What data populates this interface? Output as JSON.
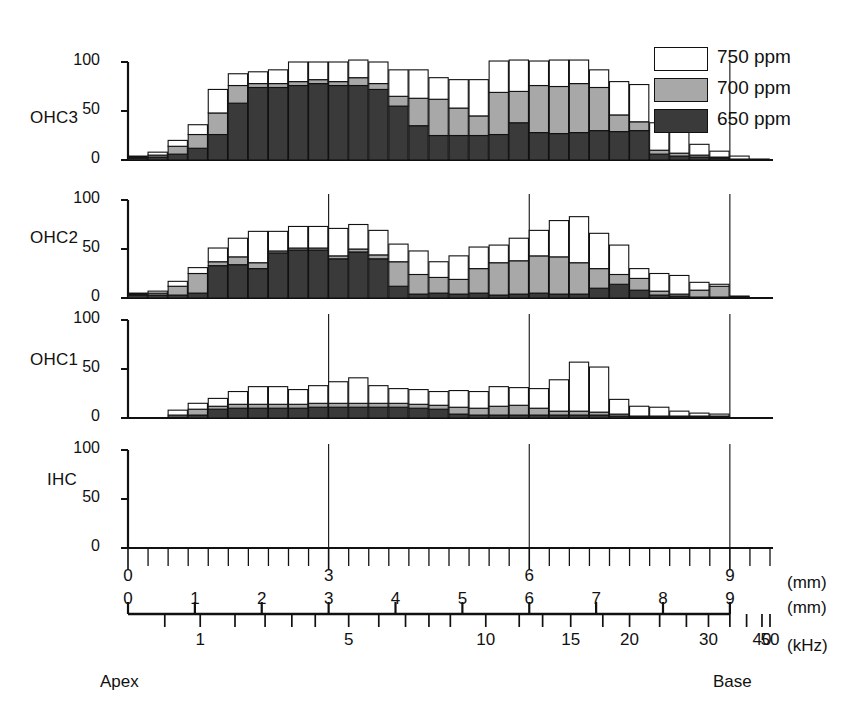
{
  "figure": {
    "type": "cochleogram",
    "panels_order": [
      "OHC3",
      "OHC2",
      "OHC1",
      "IHC"
    ],
    "apex_label": "Apex",
    "base_label": "Base"
  },
  "legend": {
    "position": "top-right",
    "items": [
      {
        "label": "750 ppm",
        "color": "#ffffff"
      },
      {
        "label": "700 ppm",
        "color": "#a8a8a8"
      },
      {
        "label": "650 ppm",
        "color": "#3a3a3a"
      }
    ]
  },
  "yaxis": {
    "ticks": [
      "0",
      "50",
      "100"
    ],
    "tick_values": [
      0,
      50,
      100
    ],
    "min": 0,
    "max": 100
  },
  "xaxis_rows": [
    {
      "unit": "(mm)",
      "labels": [
        "0",
        "3",
        "6",
        "9"
      ],
      "label_positions": [
        0,
        3,
        6,
        9
      ],
      "scale": "linear",
      "range": [
        0,
        9.6
      ]
    },
    {
      "unit": "(mm)",
      "labels": [
        "0",
        "1",
        "2",
        "3",
        "4",
        "5",
        "6",
        "7",
        "8",
        "9"
      ],
      "label_positions": [
        0,
        1,
        2,
        3,
        4,
        5,
        6,
        7,
        8,
        9
      ],
      "scale": "linear",
      "range": [
        0,
        9.6
      ]
    },
    {
      "unit": "(kHz)",
      "labels": [
        "1",
        "5",
        "10",
        "15",
        "20",
        "30",
        "40",
        "50"
      ],
      "label_positions": [
        1.08,
        3.3,
        5.35,
        6.62,
        7.5,
        8.68,
        9.48,
        10.03
      ],
      "scale": "log-ish",
      "range": [
        0,
        9.6
      ]
    }
  ],
  "panel_labels": {
    "ohc3": "OHC3",
    "ohc2": "OHC2",
    "ohc1": "OHC1",
    "ihc": "IHC"
  },
  "chart_data": {
    "type": "bar",
    "subtype": "stacked-bar-multipanel",
    "title": "",
    "xlabel": "Distance from apex (mm) / Frequency (kHz)",
    "ylabel": "Hair cell loss (%)",
    "ylim": [
      0,
      100
    ],
    "xlim": [
      0,
      9.6
    ],
    "grid": "vertical gridlines at 3, 6, 9 mm",
    "legend_position": "top right",
    "bar_width_mm": 0.3,
    "bin_starts_mm": [
      0.0,
      0.3,
      0.6,
      0.9,
      1.2,
      1.5,
      1.8,
      2.1,
      2.4,
      2.7,
      3.0,
      3.3,
      3.6,
      3.9,
      4.2,
      4.5,
      4.8,
      5.1,
      5.4,
      5.7,
      6.0,
      6.3,
      6.6,
      6.9,
      7.2,
      7.5,
      7.8,
      8.1,
      8.4,
      8.7,
      9.0,
      9.3
    ],
    "series": [
      {
        "name": "650 ppm",
        "color": "#3a3a3a"
      },
      {
        "name": "700 ppm",
        "color": "#a8a8a8"
      },
      {
        "name": "750 ppm",
        "color": "#ffffff"
      }
    ],
    "panels": [
      {
        "name": "OHC3",
        "values_650": [
          2,
          3,
          6,
          12,
          26,
          58,
          74,
          74,
          76,
          78,
          76,
          76,
          72,
          55,
          35,
          25,
          25,
          25,
          26,
          38,
          28,
          27,
          28,
          30,
          29,
          30,
          6,
          4,
          3,
          2,
          1,
          0
        ],
        "values_700": [
          1,
          2,
          8,
          14,
          22,
          18,
          4,
          4,
          4,
          4,
          4,
          8,
          6,
          10,
          28,
          37,
          28,
          20,
          43,
          32,
          48,
          48,
          50,
          44,
          17,
          9,
          4,
          3,
          2,
          1,
          0,
          0
        ],
        "values_750": [
          1,
          3,
          6,
          10,
          24,
          12,
          12,
          14,
          20,
          18,
          20,
          18,
          22,
          27,
          29,
          22,
          29,
          37,
          32,
          32,
          25,
          27,
          24,
          18,
          34,
          38,
          28,
          25,
          11,
          6,
          3,
          1
        ]
      },
      {
        "name": "OHC2",
        "values_650": [
          3,
          3,
          3,
          5,
          33,
          34,
          30,
          46,
          49,
          49,
          40,
          47,
          40,
          12,
          4,
          5,
          4,
          5,
          3,
          4,
          5,
          4,
          4,
          10,
          14,
          8,
          3,
          2,
          1,
          1,
          0,
          0
        ],
        "values_700": [
          1,
          2,
          9,
          20,
          4,
          8,
          6,
          2,
          2,
          2,
          3,
          3,
          4,
          25,
          20,
          16,
          15,
          25,
          33,
          34,
          38,
          38,
          32,
          20,
          10,
          12,
          4,
          2,
          7,
          11,
          1,
          0
        ],
        "values_750": [
          1,
          2,
          5,
          6,
          14,
          19,
          32,
          20,
          22,
          22,
          28,
          25,
          25,
          18,
          24,
          16,
          24,
          22,
          18,
          23,
          26,
          37,
          47,
          36,
          30,
          10,
          18,
          19,
          8,
          2,
          1,
          0
        ]
      },
      {
        "name": "OHC1",
        "values_650": [
          0,
          0,
          1,
          3,
          9,
          10,
          10,
          10,
          10,
          11,
          11,
          11,
          11,
          11,
          10,
          9,
          4,
          3,
          3,
          3,
          3,
          3,
          3,
          3,
          2,
          1,
          1,
          1,
          1,
          1,
          0,
          0
        ],
        "values_700": [
          0,
          0,
          2,
          6,
          3,
          4,
          4,
          4,
          4,
          4,
          4,
          4,
          4,
          4,
          4,
          4,
          7,
          7,
          9,
          10,
          7,
          4,
          4,
          3,
          2,
          1,
          1,
          1,
          1,
          1,
          0,
          0
        ],
        "values_750": [
          0,
          0,
          5,
          6,
          8,
          13,
          18,
          18,
          15,
          18,
          22,
          26,
          18,
          15,
          15,
          14,
          17,
          17,
          20,
          18,
          20,
          32,
          50,
          46,
          15,
          10,
          9,
          5,
          3,
          2,
          0,
          0
        ]
      },
      {
        "name": "IHC",
        "values_650": [
          0,
          0,
          0,
          0,
          0,
          0,
          0,
          0,
          0,
          0,
          0,
          0,
          0,
          0,
          0,
          0,
          0,
          0,
          0,
          0,
          0,
          0,
          0,
          0,
          0,
          0,
          0,
          0,
          0,
          0,
          0,
          0
        ],
        "values_700": [
          0,
          0,
          0,
          0,
          0,
          0,
          0,
          0,
          0,
          0,
          0,
          0,
          0,
          0,
          0,
          0,
          0,
          0,
          0,
          0,
          0,
          0,
          0,
          0,
          0,
          0,
          0,
          0,
          0,
          0,
          0,
          0
        ],
        "values_750": [
          0,
          0,
          0,
          0,
          0,
          0,
          0,
          0,
          0,
          0,
          0,
          0,
          0,
          0,
          0,
          0,
          0,
          0,
          0,
          0,
          0,
          0,
          0,
          0,
          0,
          0,
          0,
          0,
          0,
          0,
          0,
          0
        ]
      }
    ]
  }
}
